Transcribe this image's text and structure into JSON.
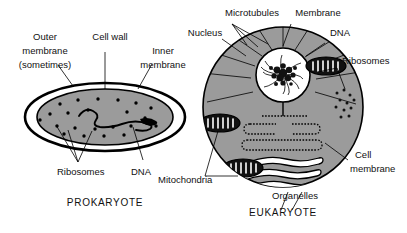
{
  "figure": {
    "title_prokaryote": "PROKARYOTE",
    "title_eukaryote": "EUKARYOTE",
    "colors": {
      "cytoplasm": "#9b9b9b",
      "outline": "#000000",
      "background": "#ffffff",
      "organelle_fill": "#ffffff"
    }
  },
  "prokaryote": {
    "caption": "PROKARYOTE",
    "labels": {
      "outer_membrane_l1": "Outer",
      "outer_membrane_l2": "membrane",
      "outer_membrane_l3": "(sometimes)",
      "cell_wall": "Cell wall",
      "inner_membrane_l1": "Inner",
      "inner_membrane_l2": "membrane",
      "ribosomes": "Ribosomes",
      "dna": "DNA"
    }
  },
  "eukaryote": {
    "caption": "EUKARYOTE",
    "labels": {
      "microtubules": "Microtubules",
      "membrane": "Membrane",
      "nucleus": "Nucleus",
      "dna": "DNA",
      "ribosomes": "Ribosomes",
      "mitochondria": "Mitochondria",
      "organelles": "Organelles",
      "cell_membrane_l1": "Cell",
      "cell_membrane_l2": "membrane"
    }
  }
}
